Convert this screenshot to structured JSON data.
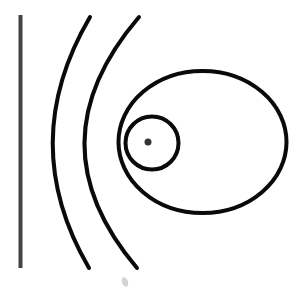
{
  "canvas": {
    "width": 306,
    "height": 292,
    "background": "#ffffff"
  },
  "colors": {
    "stroke": "#0a0a0a",
    "wall": "#444444",
    "dot": "#333333",
    "smudge": "#b8b8b8"
  },
  "wall": {
    "x1": 20.5,
    "y1": 15,
    "x2": 20.5,
    "y2": 268,
    "width": 4
  },
  "arcs": [
    {
      "name": "outer-arc-1",
      "start": [
        90,
        17
      ],
      "control": [
        16,
        143
      ],
      "end": [
        89,
        268
      ],
      "width": 4
    },
    {
      "name": "outer-arc-2",
      "start": [
        139,
        17
      ],
      "control": [
        31,
        143
      ],
      "end": [
        137,
        268
      ],
      "width": 4
    }
  ],
  "ellipse": {
    "cx": 202.5,
    "cy": 142,
    "rx": 84,
    "ry": 71,
    "width": 4
  },
  "inner_circle": {
    "cx": 152,
    "cy": 143,
    "r": 26.5,
    "width": 4
  },
  "center_dot": {
    "cx": 148,
    "cy": 142,
    "r": 3.5
  },
  "smudge": {
    "cx": 125,
    "cy": 282,
    "rx": 3,
    "ry": 5
  }
}
